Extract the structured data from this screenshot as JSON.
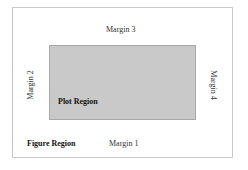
{
  "diagram": {
    "figure_region_label": "Figure Region",
    "plot_region_label": "Plot Region",
    "margins": {
      "bottom": "Margin 1",
      "left": "Margin 2",
      "top": "Margin 3",
      "right": "Margin 4"
    },
    "colors": {
      "plot_fill": "#c9c9c9",
      "border": "#c8c8c8"
    }
  }
}
